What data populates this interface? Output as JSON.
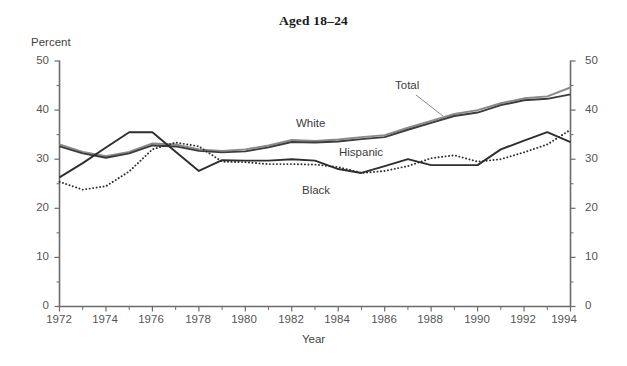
{
  "chart": {
    "title": "Aged 18–24",
    "ylabel": "Percent",
    "xlabel": "Year"
  },
  "axes": {
    "y_ticks": [
      "0",
      "10",
      "20",
      "30",
      "40",
      "50"
    ],
    "x_ticks": [
      "1972",
      "1974",
      "1976",
      "1978",
      "1980",
      "1982",
      "1984",
      "1986",
      "1988",
      "1990",
      "1992",
      "1994"
    ]
  },
  "series_labels": {
    "total": "Total",
    "white": "White",
    "hispanic": "Hispanic",
    "black": "Black"
  },
  "colors": {
    "total": "#8a8a8a",
    "white": "#3d3d3d",
    "black": "#2e2e2e",
    "hispanic": "#2e2e2e",
    "axis": "#6b6b6b",
    "text": "#3a3a3a"
  },
  "chart_data": {
    "type": "line",
    "title": "Aged 18–24",
    "xlabel": "Year",
    "ylabel": "Percent",
    "xlim": [
      1972,
      1994
    ],
    "ylim": [
      0,
      50
    ],
    "y_ticks": [
      0,
      10,
      20,
      30,
      40,
      50
    ],
    "x_ticks": [
      1972,
      1974,
      1976,
      1978,
      1980,
      1982,
      1984,
      1986,
      1988,
      1990,
      1992,
      1994
    ],
    "minor_x_ticks_every": 1,
    "grid": false,
    "legend": "inline-annotations",
    "x": [
      1972,
      1973,
      1974,
      1975,
      1976,
      1977,
      1978,
      1979,
      1980,
      1981,
      1982,
      1983,
      1984,
      1985,
      1986,
      1987,
      1988,
      1989,
      1990,
      1991,
      1992,
      1993,
      1994
    ],
    "series": [
      {
        "name": "Total",
        "style": "solid",
        "color": "#8a8a8a",
        "values": [
          33.0,
          31.5,
          30.6,
          31.5,
          33.2,
          33.0,
          32.0,
          31.7,
          32.0,
          32.8,
          33.9,
          33.7,
          34.0,
          34.5,
          34.9,
          36.4,
          37.8,
          39.2,
          40.0,
          41.4,
          42.4,
          42.8,
          44.6
        ]
      },
      {
        "name": "White",
        "style": "solid",
        "color": "#3d3d3d",
        "values": [
          32.6,
          31.2,
          30.3,
          31.2,
          32.8,
          32.6,
          31.7,
          31.4,
          31.6,
          32.4,
          33.5,
          33.4,
          33.6,
          34.1,
          34.5,
          36.0,
          37.4,
          38.8,
          39.5,
          41.0,
          42.0,
          42.3,
          43.2
        ]
      },
      {
        "name": "Black",
        "style": "solid",
        "color": "#2e2e2e",
        "values": [
          26.3,
          29.2,
          32.4,
          35.5,
          35.5,
          31.5,
          27.6,
          29.8,
          29.7,
          29.7,
          30.0,
          29.7,
          28.0,
          27.2,
          28.6,
          30.0,
          28.8,
          28.8,
          28.8,
          32.0,
          33.8,
          35.5,
          33.5
        ]
      },
      {
        "name": "Hispanic",
        "style": "dotted",
        "color": "#2e2e2e",
        "values": [
          25.4,
          23.8,
          24.5,
          27.5,
          32.0,
          33.4,
          32.6,
          29.5,
          29.4,
          29.0,
          29.0,
          28.9,
          28.4,
          27.2,
          27.6,
          28.6,
          30.2,
          30.8,
          29.5,
          30.0,
          31.4,
          33.0,
          36.0
        ]
      }
    ]
  }
}
